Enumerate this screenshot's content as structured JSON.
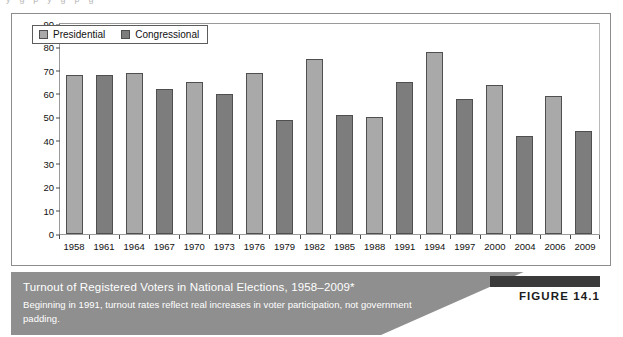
{
  "figure": {
    "tag_label": "FIGURE 14.1",
    "caption_title": "Turnout of Registered Voters in National Elections, 1958–2009*",
    "caption_subtitle": "Beginning in 1991, turnout rates reflect real increases in voter participation, not government padding.",
    "scan_artifact_text": "y g p y g p g"
  },
  "colors": {
    "presidential": "#a9a9a9",
    "congressional": "#7d7d7d",
    "bar_border": "#4f4f4f",
    "band": "#8f8f8f",
    "frame": "#8d8d8d",
    "text": "#111111",
    "caption_text": "#ffffff",
    "figure_tag_bar": "#3a3a3a"
  },
  "chart_data": {
    "type": "bar",
    "title": "Turnout of Registered Voters in National Elections, 1958–2009*",
    "xlabel": "",
    "ylabel": "Percentage",
    "ylim": [
      0,
      90
    ],
    "yticks": [
      0,
      10,
      20,
      30,
      40,
      50,
      60,
      70,
      80,
      90
    ],
    "grid": false,
    "legend_position": "top-left",
    "legend": [
      "Presidential",
      "Congressional"
    ],
    "categories": [
      "1958",
      "1961",
      "1964",
      "1967",
      "1970",
      "1973",
      "1976",
      "1979",
      "1982",
      "1985",
      "1988",
      "1991",
      "1994",
      "1997",
      "2000",
      "2004",
      "2006",
      "2009"
    ],
    "values": [
      68,
      68,
      69,
      62,
      65,
      60,
      69,
      49,
      75,
      51,
      50,
      65,
      78,
      58,
      64,
      42,
      59,
      44
    ],
    "series_of_bar": [
      "Presidential",
      "Congressional",
      "Presidential",
      "Congressional",
      "Presidential",
      "Congressional",
      "Presidential",
      "Congressional",
      "Presidential",
      "Congressional",
      "Presidential",
      "Congressional",
      "Presidential",
      "Congressional",
      "Presidential",
      "Congressional",
      "Presidential",
      "Congressional"
    ],
    "bars": [
      {
        "year": "1958",
        "value": 68,
        "type": "Presidential"
      },
      {
        "year": "1961",
        "value": 68,
        "type": "Congressional"
      },
      {
        "year": "1964",
        "value": 69,
        "type": "Presidential"
      },
      {
        "year": "1967",
        "value": 62,
        "type": "Congressional"
      },
      {
        "year": "1970",
        "value": 65,
        "type": "Presidential"
      },
      {
        "year": "1973",
        "value": 60,
        "type": "Congressional"
      },
      {
        "year": "1976",
        "value": 69,
        "type": "Presidential"
      },
      {
        "year": "1979",
        "value": 49,
        "type": "Congressional"
      },
      {
        "year": "1982",
        "value": 75,
        "type": "Presidential"
      },
      {
        "year": "1985",
        "value": 51,
        "type": "Congressional"
      },
      {
        "year": "1988",
        "value": 50,
        "type": "Presidential"
      },
      {
        "year": "1991",
        "value": 65,
        "type": "Congressional"
      },
      {
        "year": "1994",
        "value": 78,
        "type": "Presidential"
      },
      {
        "year": "1997",
        "value": 58,
        "type": "Congressional"
      },
      {
        "year": "2000",
        "value": 64,
        "type": "Presidential"
      },
      {
        "year": "2004",
        "value": 42,
        "type": "Congressional"
      },
      {
        "year": "2006",
        "value": 59,
        "type": "Presidential"
      },
      {
        "year": "2009",
        "value": 44,
        "type": "Congressional"
      }
    ]
  }
}
